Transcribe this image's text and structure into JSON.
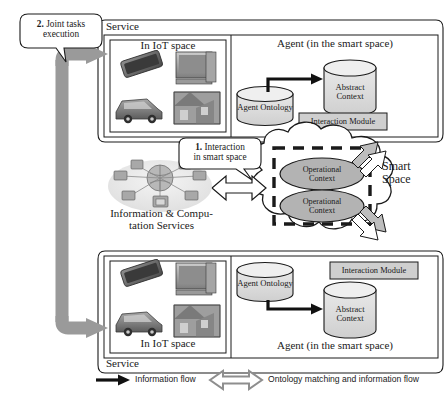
{
  "figure": {
    "type": "diagram"
  },
  "callouts": [
    {
      "id": "joint-tasks",
      "number": "2.",
      "line1": "Joint tasks",
      "line2": "execution"
    },
    {
      "id": "interaction",
      "number": "1.",
      "line1": "Interaction",
      "line2": "in smart space"
    }
  ],
  "top_service": {
    "service_label": "Service",
    "iot": {
      "label": "In IoT space",
      "devices": [
        "smartphone",
        "desktop-computer",
        "car",
        "smart-home"
      ]
    },
    "agent": {
      "label": "Agent (in the smart space)",
      "ontology_label": "Agent Ontology",
      "abstract_context_line1": "Abstract",
      "abstract_context_line2": "Context",
      "interaction_module_label": "Interaction Module"
    }
  },
  "bottom_service": {
    "service_label": "Service",
    "iot": {
      "label": "In IoT space",
      "devices": [
        "smartphone",
        "desktop-computer",
        "car",
        "smart-home"
      ]
    },
    "agent": {
      "label": "Agent (in the smart space)",
      "ontology_label": "Agent Ontology",
      "abstract_context_line1": "Abstract",
      "abstract_context_line2": "Context",
      "interaction_module_label": "Interaction Module"
    }
  },
  "smart_space": {
    "label_line1": "Smart",
    "label_line2": "Space",
    "contexts": [
      {
        "line1": "Operational",
        "line2": "Context"
      },
      {
        "line1": "Operational",
        "line2": "Context"
      }
    ]
  },
  "center": {
    "label_line1": "Information & Compu-",
    "label_line2": "tation Services",
    "graphic": "network-cloud-devices"
  },
  "legend": [
    {
      "icon": "black-arrow-icon",
      "label": "Information flow"
    },
    {
      "icon": "gray-double-arrow-icon",
      "label": "Ontology matching and information flow"
    }
  ],
  "colors": {
    "ink": "#1a1a1a",
    "gray_arrow": "#9a9a9a",
    "gray_arrow_dark": "#8a8a8a",
    "context_fill": "#b3b3b3",
    "cylinder_fill": "#d8d8d8",
    "module_fill": "#cfcfcf",
    "white": "#ffffff"
  }
}
